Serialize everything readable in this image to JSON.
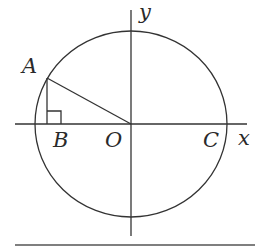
{
  "diagram": {
    "type": "unit-circle-geometry",
    "colors": {
      "stroke": "#333333",
      "text": "#2a2a2a",
      "background": "#ffffff"
    },
    "axes": {
      "x_label": "x",
      "y_label": "y"
    },
    "points": [
      {
        "id": "A",
        "label": "A",
        "desc": "point on circle in second quadrant"
      },
      {
        "id": "B",
        "label": "B",
        "desc": "foot of perpendicular from A to x-axis"
      },
      {
        "id": "O",
        "label": "O",
        "desc": "origin / circle center"
      },
      {
        "id": "C",
        "label": "C",
        "desc": "circle intersects positive x-axis"
      }
    ],
    "segments": [
      "AO",
      "AB"
    ],
    "right_angle_at": "B",
    "circle": {
      "center": "O"
    }
  }
}
